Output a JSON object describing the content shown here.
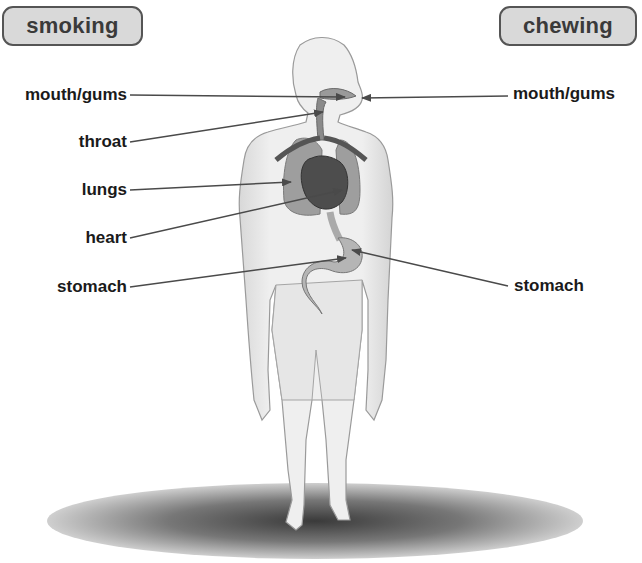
{
  "header": {
    "left_category": "smoking",
    "right_category": "chewing"
  },
  "labels": {
    "left": [
      {
        "text": "mouth/gums",
        "target": "mouth"
      },
      {
        "text": "throat",
        "target": "throat"
      },
      {
        "text": "lungs",
        "target": "lungs"
      },
      {
        "text": "heart",
        "target": "heart"
      },
      {
        "text": "stomach",
        "target": "stomach"
      }
    ],
    "right": [
      {
        "text": "mouth/gums",
        "target": "mouth"
      },
      {
        "text": "stomach",
        "target": "stomach"
      }
    ]
  },
  "figure": {
    "organs": [
      "mouth",
      "throat",
      "lungs",
      "heart",
      "stomach"
    ]
  },
  "colors": {
    "pill_fill": "#d9d9d9",
    "pill_border": "#555555",
    "label_text": "#1a1a1a",
    "leader_line": "#4a4a4a",
    "body_fill": "#ececec",
    "organ_fill": "#8a8a8a",
    "heart_fill": "#4d4d4d"
  }
}
